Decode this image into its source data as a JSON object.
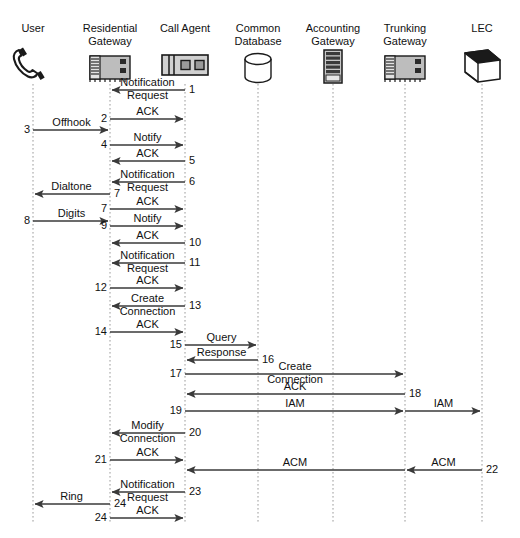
{
  "diagram": {
    "type": "sequence-diagram",
    "title": "",
    "colors": {
      "line": "#3a3a3a",
      "lifeline": "#9a9a9a",
      "text": "#111111",
      "device_fill": "#bdbdbd",
      "device_stroke": "#1a1a1a"
    },
    "participants": [
      {
        "id": "user",
        "label": "User",
        "label_lines": [
          "User"
        ],
        "icon": "telephone-handset-icon",
        "x": 33
      },
      {
        "id": "rg",
        "label": "Residential Gateway",
        "label_lines": [
          "Residential",
          "Gateway"
        ],
        "icon": "gateway-device-icon",
        "x": 110
      },
      {
        "id": "ca",
        "label": "Call Agent",
        "label_lines": [
          "Call Agent"
        ],
        "icon": "call-agent-device-icon",
        "x": 185
      },
      {
        "id": "db",
        "label": "Common Database",
        "label_lines": [
          "Common",
          "Database"
        ],
        "icon": "database-cylinder-icon",
        "x": 258
      },
      {
        "id": "acct",
        "label": "Accounting Gateway",
        "label_lines": [
          "Accounting",
          "Gateway"
        ],
        "icon": "server-rack-icon",
        "x": 333
      },
      {
        "id": "trunk",
        "label": "Trunking Gateway",
        "label_lines": [
          "Trunking",
          "Gateway"
        ],
        "icon": "gateway-device-icon",
        "x": 405
      },
      {
        "id": "lec",
        "label": "LEC",
        "label_lines": [
          "LEC"
        ],
        "icon": "network-cloud-box-icon",
        "x": 482
      }
    ],
    "lifeline_top": 84,
    "lifeline_bottom": 524,
    "messages": [
      {
        "seq": "1",
        "label": "Notification Request",
        "label_lines": [
          "Notification",
          "Request"
        ],
        "from": "ca",
        "to": "rg",
        "y": 90,
        "num_side": "right"
      },
      {
        "seq": "2",
        "label": "ACK",
        "label_lines": [
          "ACK"
        ],
        "from": "rg",
        "to": "ca",
        "y": 119,
        "num_side": "left"
      },
      {
        "seq": "3",
        "label": "Offhook",
        "label_lines": [
          "Offhook"
        ],
        "from": "user",
        "to": "rg",
        "y": 130,
        "num_side": "left"
      },
      {
        "seq": "4",
        "label": "Notify",
        "label_lines": [
          "Notify"
        ],
        "from": "rg",
        "to": "ca",
        "y": 145,
        "num_side": "left"
      },
      {
        "seq": "5",
        "label": "ACK",
        "label_lines": [
          "ACK"
        ],
        "from": "ca",
        "to": "rg",
        "y": 161,
        "num_side": "right"
      },
      {
        "seq": "6",
        "label": "Notification Request",
        "label_lines": [
          "Notification",
          "Request"
        ],
        "from": "ca",
        "to": "rg",
        "y": 182,
        "num_side": "right"
      },
      {
        "seq": "7",
        "label": "Dialtone",
        "label_lines": [
          "Dialtone"
        ],
        "from": "rg",
        "to": "user",
        "y": 194,
        "num_side": "right"
      },
      {
        "seq": "7",
        "label": "ACK",
        "label_lines": [
          "ACK"
        ],
        "from": "rg",
        "to": "ca",
        "y": 209,
        "num_side": "left"
      },
      {
        "seq": "8",
        "label": "Digits",
        "label_lines": [
          "Digits"
        ],
        "from": "user",
        "to": "rg",
        "y": 221,
        "num_side": "left"
      },
      {
        "seq": "9",
        "label": "Notify",
        "label_lines": [
          "Notify"
        ],
        "from": "rg",
        "to": "ca",
        "y": 226,
        "num_side": "left"
      },
      {
        "seq": "10",
        "label": "ACK",
        "label_lines": [
          "ACK"
        ],
        "from": "ca",
        "to": "rg",
        "y": 243,
        "num_side": "right"
      },
      {
        "seq": "11",
        "label": "Notification Request",
        "label_lines": [
          "Notification",
          "Request"
        ],
        "from": "ca",
        "to": "rg",
        "y": 263,
        "num_side": "right"
      },
      {
        "seq": "12",
        "label": "ACK",
        "label_lines": [
          "ACK"
        ],
        "from": "rg",
        "to": "ca",
        "y": 288,
        "num_side": "left"
      },
      {
        "seq": "13",
        "label": "Create Connection",
        "label_lines": [
          "Create",
          "Connection"
        ],
        "from": "ca",
        "to": "rg",
        "y": 306,
        "num_side": "right"
      },
      {
        "seq": "14",
        "label": "ACK",
        "label_lines": [
          "ACK"
        ],
        "from": "rg",
        "to": "ca",
        "y": 332,
        "num_side": "left"
      },
      {
        "seq": "15",
        "label": "Query",
        "label_lines": [
          "Query"
        ],
        "from": "ca",
        "to": "db",
        "y": 345,
        "num_side": "left"
      },
      {
        "seq": "16",
        "label": "Response",
        "label_lines": [
          "Response"
        ],
        "from": "db",
        "to": "ca",
        "y": 360,
        "num_side": "right"
      },
      {
        "seq": "17",
        "label": "Create Connection",
        "label_lines": [
          "Create",
          "Connection"
        ],
        "from": "ca",
        "to": "trunk",
        "y": 374,
        "num_side": "left"
      },
      {
        "seq": "18",
        "label": "ACK",
        "label_lines": [
          "ACK"
        ],
        "from": "trunk",
        "to": "ca",
        "y": 394,
        "num_side": "right"
      },
      {
        "seq": "19",
        "label": "IAM",
        "label_lines": [
          "IAM"
        ],
        "from": "ca",
        "to": "trunk",
        "y": 411,
        "num_side": "left"
      },
      {
        "seq": "19b",
        "label": "IAM",
        "label_lines": [
          "IAM"
        ],
        "from": "trunk",
        "to": "lec",
        "y": 411,
        "num_side": "none"
      },
      {
        "seq": "20",
        "label": "Modify Connection",
        "label_lines": [
          "Modify",
          "Connection"
        ],
        "from": "ca",
        "to": "rg",
        "y": 433,
        "num_side": "right"
      },
      {
        "seq": "21",
        "label": "ACK",
        "label_lines": [
          "ACK"
        ],
        "from": "rg",
        "to": "ca",
        "y": 460,
        "num_side": "left"
      },
      {
        "seq": "22",
        "label": "ACM",
        "label_lines": [
          "ACM"
        ],
        "from": "lec",
        "to": "trunk",
        "y": 470,
        "num_side": "right"
      },
      {
        "seq": "22b",
        "label": "ACM",
        "label_lines": [
          "ACM"
        ],
        "from": "trunk",
        "to": "ca",
        "y": 470,
        "num_side": "none"
      },
      {
        "seq": "23",
        "label": "Notification Request",
        "label_lines": [
          "Notification",
          "Request"
        ],
        "from": "ca",
        "to": "rg",
        "y": 492,
        "num_side": "right"
      },
      {
        "seq": "24",
        "label": "Ring",
        "label_lines": [
          "Ring"
        ],
        "from": "rg",
        "to": "user",
        "y": 504,
        "num_side": "right"
      },
      {
        "seq": "24",
        "label": "ACK",
        "label_lines": [
          "ACK"
        ],
        "from": "rg",
        "to": "ca",
        "y": 518,
        "num_side": "left"
      }
    ]
  }
}
